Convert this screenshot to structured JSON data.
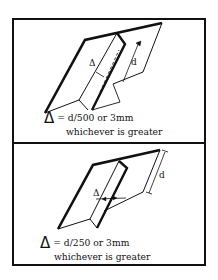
{
  "panels": [
    {
      "id": "top",
      "symbol": "Δ",
      "dimension_label": "d",
      "delta_label": "Δ",
      "formula": "= d/500 or 3mm",
      "note": "whichever is greater"
    },
    {
      "id": "bottom",
      "symbol": "Δ",
      "dimension_label": "d",
      "delta_label": "Δ",
      "formula": "= d/250 or 3mm",
      "note": "whichever is greater"
    }
  ],
  "colors": {
    "line": "#111111",
    "background": "#ffffff"
  }
}
